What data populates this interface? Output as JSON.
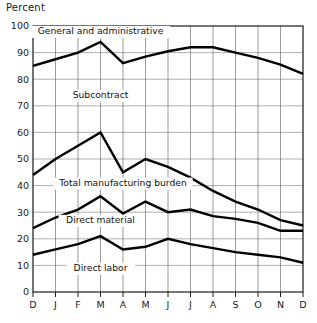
{
  "axis_title": "Percent",
  "chart_data": {
    "type": "line",
    "title": "",
    "xlabel": "",
    "ylabel": "Percent",
    "ylim": [
      0,
      100
    ],
    "ytick_values": [
      0,
      10,
      20,
      30,
      40,
      50,
      60,
      70,
      80,
      90,
      100
    ],
    "ytick_labels": [
      "0",
      "10",
      "20",
      "30",
      "40",
      "50",
      "60",
      "70",
      "80",
      "90",
      "100"
    ],
    "grid": true,
    "legend": "inline-annotations",
    "categories": [
      "D",
      "J",
      "F",
      "M",
      "A",
      "M",
      "J",
      "J",
      "A",
      "S",
      "O",
      "N",
      "D"
    ],
    "series": [
      {
        "name": "General and administrative",
        "values": [
          85,
          87.5,
          90,
          94,
          86,
          88.5,
          90.5,
          92,
          92,
          90,
          88,
          85.5,
          82
        ]
      },
      {
        "name": "Total manufacturing burden",
        "values": [
          44,
          50,
          55,
          60,
          45,
          50,
          47,
          43,
          38,
          34,
          31,
          27,
          25
        ]
      },
      {
        "name": "Direct material",
        "values": [
          24,
          28,
          31,
          36,
          29.5,
          34,
          30,
          31,
          28.5,
          27.5,
          26,
          23,
          23
        ]
      },
      {
        "name": "Direct labor",
        "values": [
          14,
          16,
          18,
          21,
          16,
          17,
          20,
          18,
          16.5,
          15,
          14,
          13,
          11
        ]
      }
    ],
    "annotations": [
      {
        "text": "General and administrative",
        "x_category": "M",
        "y": 97
      },
      {
        "text": "Subcontract",
        "x_category": "M",
        "y": 73
      },
      {
        "text": "Total manufacturing burden",
        "x_category": "A",
        "y": 40
      },
      {
        "text": "Direct material",
        "x_category": "M",
        "y": 26
      },
      {
        "text": "Direct labor",
        "x_category": "M",
        "y": 8
      }
    ]
  },
  "labels": {
    "general_admin": "General and administrative",
    "subcontract": "Subcontract",
    "total_burden": "Total manufacturing burden",
    "direct_material": "Direct material",
    "direct_labor": "Direct labor"
  },
  "colors": {
    "line": "#000000",
    "grid": "#8e8e8e",
    "frame": "#1a1a1a",
    "background": "#ffffff"
  }
}
